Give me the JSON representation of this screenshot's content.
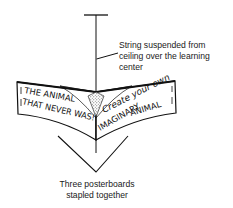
{
  "diagram": {
    "callouts": {
      "string": {
        "lines": [
          "String suspended from",
          "ceiling over the learning",
          "center"
        ]
      },
      "boards": {
        "lines": [
          "Three posterboards",
          "stapled together"
        ]
      }
    },
    "left_board": {
      "line1": "THE ANIMAL",
      "line2": "THAT NEVER WAS!"
    },
    "right_board": {
      "line1": "Create your own",
      "line2": "IMAGINARY",
      "line3": "ANIMAL"
    },
    "colors": {
      "ink": "#111111",
      "paper": "#ffffff",
      "stipple": "#9a9a9a"
    }
  }
}
